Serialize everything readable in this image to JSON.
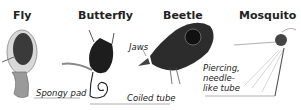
{
  "panels": [
    {
      "id": "fly",
      "title": "Fly",
      "label": "Spongy pad"
    },
    {
      "id": "butterfly",
      "title": "Butterfly",
      "label": "Coiled tube"
    },
    {
      "id": "beetle",
      "title": "Beetle",
      "label": "Jaws"
    },
    {
      "id": "mosquito",
      "title": "Mosquito",
      "label_lines": [
        "Piercing,",
        "needle-",
        "like tube"
      ]
    }
  ]
}
